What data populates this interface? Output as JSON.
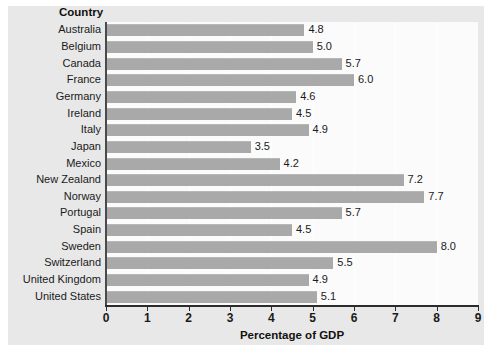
{
  "chart_data": {
    "type": "bar",
    "orientation": "horizontal",
    "title": "",
    "xlabel": "Percentage of GDP",
    "ylabel": "Country",
    "categories": [
      "Australia",
      "Belgium",
      "Canada",
      "France",
      "Germany",
      "Ireland",
      "Italy",
      "Japan",
      "Mexico",
      "New Zealand",
      "Norway",
      "Portugal",
      "Spain",
      "Sweden",
      "Switzerland",
      "United Kingdom",
      "United States"
    ],
    "values": [
      4.8,
      5.0,
      5.7,
      6.0,
      4.6,
      4.5,
      4.9,
      3.5,
      4.2,
      7.2,
      7.7,
      5.7,
      4.5,
      8.0,
      5.5,
      4.9,
      5.1
    ],
    "value_labels": [
      "4.8",
      "5.0",
      "5.7",
      "6.0",
      "4.6",
      "4.5",
      "4.9",
      "3.5",
      "4.2",
      "7.2",
      "7.7",
      "5.7",
      "4.5",
      "8.0",
      "5.5",
      "4.9",
      "5.1"
    ],
    "xlim": [
      0,
      9
    ],
    "xticks": [
      0,
      1,
      2,
      3,
      4,
      5,
      6,
      7,
      8,
      9
    ],
    "xtick_labels": [
      "0",
      "1",
      "2",
      "3",
      "4",
      "5",
      "6",
      "7",
      "8",
      "9"
    ],
    "grid": "vertical",
    "legend": "none",
    "bar_color": "#a9a9a9",
    "panel_color": "#e8e8e8",
    "plot_background": "#fbfbfb",
    "axis_color": "#2b2b2b"
  }
}
